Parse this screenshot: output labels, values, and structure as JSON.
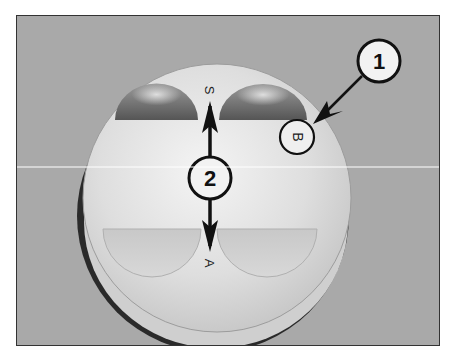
{
  "figure": {
    "callouts": [
      {
        "id": "1",
        "label": "1",
        "points_to": "B mark"
      },
      {
        "id": "2",
        "label": "2",
        "points_to": "S-A arrow"
      }
    ],
    "stamped_marks": {
      "top": "S",
      "bottom": "A",
      "side": "B"
    }
  },
  "colors": {
    "background": "#a9a9a9",
    "piston_face": "#e2e2e2",
    "callout_stroke": "#111111",
    "callout_fill": "#f2f2f2"
  }
}
